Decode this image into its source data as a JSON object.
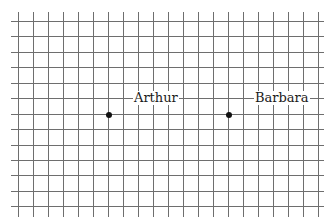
{
  "diagram": {
    "type": "grid-with-points",
    "grid": {
      "line_color": "#6e6e6e",
      "background": "#ffffff",
      "vertical_lines_x": [
        18,
        33,
        48,
        63,
        78,
        93,
        108,
        123,
        138,
        153,
        168,
        183,
        198,
        213,
        228,
        243,
        258,
        273,
        288,
        303,
        318
      ],
      "horizontal_lines_y": [
        21,
        36,
        52,
        67,
        83,
        98,
        114,
        129,
        145,
        160,
        175,
        191,
        206
      ],
      "vertical_extent": [
        12,
        217
      ],
      "horizontal_extent": [
        11,
        324
      ]
    },
    "points": [
      {
        "label": "Arthur",
        "x": 108,
        "y": 114,
        "label_x": 133,
        "label_y": 91
      },
      {
        "label": "Barbara",
        "x": 228,
        "y": 114,
        "label_x": 254,
        "label_y": 91
      }
    ],
    "dot_color": "#111111"
  }
}
